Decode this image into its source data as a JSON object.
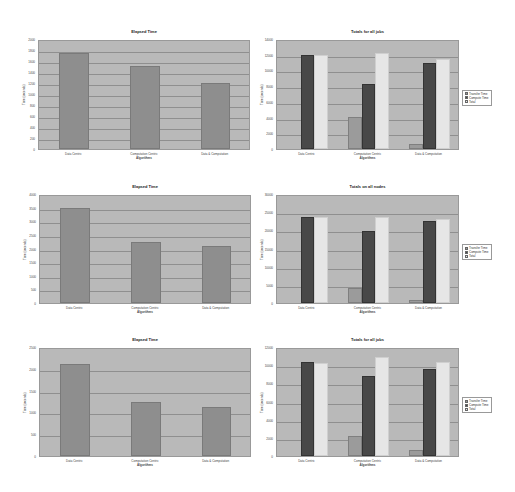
{
  "chart_data": [
    {
      "id": "tl",
      "type": "bar",
      "title": "Elapsed Time",
      "xlabel": "Algorithms",
      "ylabel": "Time (seconds)",
      "categories": [
        "Data Centric",
        "Computation Centric",
        "Data & Computation"
      ],
      "ylim": [
        0,
        2000
      ],
      "yticks": [
        0,
        200,
        400,
        600,
        800,
        1000,
        1200,
        1400,
        1600,
        1800,
        2000
      ],
      "grid": true,
      "series": [
        {
          "name": "Elapsed Time",
          "values": [
            1750,
            1510,
            1200
          ]
        }
      ]
    },
    {
      "id": "tr",
      "type": "bar",
      "title": "Totals for all jobs",
      "xlabel": "Algorithms",
      "ylabel": "Time (seconds)",
      "categories": [
        "Data Centric",
        "Computation Centric",
        "Data & Computation"
      ],
      "ylim": [
        0,
        14000
      ],
      "yticks": [
        0,
        2000,
        4000,
        6000,
        8000,
        10000,
        12000,
        14000
      ],
      "grid": true,
      "legend_position": "right",
      "series": [
        {
          "name": "Transfer Time",
          "values": [
            0,
            4100,
            700
          ]
        },
        {
          "name": "Compute Time",
          "values": [
            12000,
            8300,
            10900
          ]
        },
        {
          "name": "Total",
          "values": [
            12000,
            12200,
            11500
          ]
        }
      ]
    },
    {
      "id": "ml",
      "type": "bar",
      "title": "Elapsed Time",
      "xlabel": "Algorithms",
      "ylabel": "Time (seconds)",
      "categories": [
        "Data Centric",
        "Computation Centric",
        "Data & Computation"
      ],
      "ylim": [
        0,
        4000
      ],
      "yticks": [
        0,
        500,
        1000,
        1500,
        2000,
        2500,
        3000,
        3500,
        4000
      ],
      "grid": true,
      "series": [
        {
          "name": "Elapsed Time",
          "values": [
            3500,
            2250,
            2080
          ]
        }
      ]
    },
    {
      "id": "mr",
      "type": "bar",
      "title": "Totals on all nodes",
      "xlabel": "Algorithms",
      "ylabel": "Time (seconds)",
      "categories": [
        "Data Centric",
        "Computation Centric",
        "Data & Computation"
      ],
      "ylim": [
        0,
        30000
      ],
      "yticks": [
        0,
        5000,
        10000,
        15000,
        20000,
        25000,
        30000
      ],
      "grid": true,
      "legend_position": "right",
      "series": [
        {
          "name": "Transfer Time",
          "values": [
            0,
            4000,
            700
          ]
        },
        {
          "name": "Compute Time",
          "values": [
            23800,
            19800,
            22500
          ]
        },
        {
          "name": "Total",
          "values": [
            23700,
            23800,
            23200
          ]
        }
      ]
    },
    {
      "id": "bl",
      "type": "bar",
      "title": "Elapsed Time",
      "xlabel": "Algorithms",
      "ylabel": "Time (seconds)",
      "categories": [
        "Data Centric",
        "Computation Centric",
        "Data & Computation"
      ],
      "ylim": [
        0,
        2500
      ],
      "yticks": [
        0,
        500,
        1000,
        1500,
        2000,
        2500
      ],
      "grid": true,
      "series": [
        {
          "name": "Elapsed Time",
          "values": [
            2120,
            1250,
            1120
          ]
        }
      ]
    },
    {
      "id": "br",
      "type": "bar",
      "title": "Totals for all jobs",
      "xlabel": "Algorithms",
      "ylabel": "Time (seconds)",
      "categories": [
        "Data Centric",
        "Computation Centric",
        "Data & Computation"
      ],
      "ylim": [
        0,
        12000
      ],
      "yticks": [
        0,
        2000,
        4000,
        6000,
        8000,
        10000,
        12000
      ],
      "grid": true,
      "legend_position": "right",
      "series": [
        {
          "name": "Transfer Time",
          "values": [
            0,
            2200,
            700
          ]
        },
        {
          "name": "Compute Time",
          "values": [
            10300,
            8800,
            9600
          ]
        },
        {
          "name": "Total",
          "values": [
            10200,
            10900,
            10300
          ]
        }
      ]
    }
  ],
  "colors": {
    "plot_bg": "#b9b9b9",
    "single_bar": "#8e8e8e",
    "transfer": "#9b9b9b",
    "compute": "#484848",
    "total": "#e6e6e6"
  }
}
